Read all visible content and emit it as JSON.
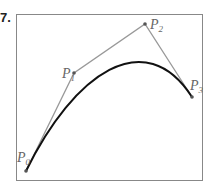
{
  "problem_number": "7.",
  "diagram": {
    "type": "cubic-bezier-curve",
    "frame": {
      "x": 16,
      "y": 14,
      "width": 186,
      "height": 166,
      "stroke": "#888888"
    },
    "control_points": [
      {
        "label": "P",
        "sub": "0",
        "x": 26,
        "y": 171
      },
      {
        "label": "P",
        "sub": "1",
        "x": 74,
        "y": 73
      },
      {
        "label": "P",
        "sub": "2",
        "x": 145,
        "y": 24
      },
      {
        "label": "P",
        "sub": "3",
        "x": 192,
        "y": 97
      }
    ],
    "polygon_color": "#999999",
    "curve_color": "#111111"
  }
}
